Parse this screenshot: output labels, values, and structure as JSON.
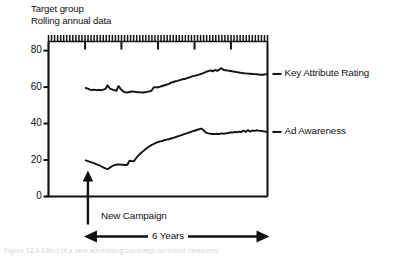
{
  "title": {
    "line1": "Target group",
    "line2": "Rolling annual data"
  },
  "legend": {
    "series1_label": "Key Attribute Rating",
    "series2_label": "Ad Awareness"
  },
  "annotations": {
    "campaign_label": "New Campaign",
    "span_label": "6 Years"
  },
  "caption": "Figure 12.4  Effect of a new advertising campaign on brand measures",
  "colors": {
    "ink": "#111111",
    "background": "#ffffff",
    "series1": "#111111",
    "series2": "#111111"
  },
  "chart_data": {
    "type": "line",
    "xlabel": "",
    "ylabel": "",
    "ylim": [
      0,
      85
    ],
    "yticks": [
      0,
      20,
      40,
      60,
      80
    ],
    "ytick_labels": [
      "0",
      "20",
      "40",
      "60",
      "80"
    ],
    "xlim": [
      0,
      100
    ],
    "grid": false,
    "legend_position": "right",
    "x_axis_note": "Time axis, unlabelled; dense minor tick ruler along the top border with 5 major ticks",
    "top_ruler": {
      "minor_tick_count": 72,
      "major_tick_positions": [
        16.7,
        33.3,
        50.0,
        66.7,
        83.3
      ]
    },
    "annotations": [
      {
        "type": "vertical-arrow",
        "text": "New Campaign",
        "x": 18.0,
        "description": "Upward arrow from below the x axis marking the campaign launch"
      },
      {
        "type": "double-arrow",
        "text": "6 Years",
        "x_start": 18.0,
        "x_end": 100.0,
        "description": "Horizontal double-headed arrow spanning the post-launch period"
      }
    ],
    "series": [
      {
        "name": "Key Attribute Rating",
        "x": [
          17,
          18,
          19,
          20,
          21,
          22,
          23,
          24,
          25,
          26,
          27,
          28,
          29,
          30,
          31,
          32,
          33,
          34,
          35,
          36,
          37,
          38,
          39,
          40,
          41,
          42,
          43,
          44,
          45,
          46,
          47,
          48,
          49,
          50,
          51,
          52,
          53,
          54,
          55,
          56,
          57,
          58,
          59,
          60,
          61,
          62,
          63,
          64,
          65,
          66,
          67,
          68,
          69,
          70,
          71,
          72,
          73,
          74,
          75,
          76,
          77,
          78,
          79,
          80,
          81,
          82,
          83,
          84,
          85,
          86,
          87,
          88,
          89,
          90,
          91,
          92,
          93,
          94,
          95,
          96,
          97,
          98,
          99,
          100
        ],
        "values": [
          59.5,
          59.2,
          58.6,
          58.4,
          58.6,
          58.3,
          58.5,
          58.3,
          58.6,
          59.0,
          61.0,
          59.2,
          58.7,
          58.3,
          58.0,
          60.6,
          58.9,
          57.7,
          57.2,
          57.0,
          57.3,
          57.6,
          57.5,
          57.3,
          57.2,
          57.1,
          57.0,
          57.2,
          57.4,
          57.6,
          58.0,
          59.8,
          60.0,
          59.8,
          60.2,
          60.6,
          61.0,
          61.4,
          61.8,
          62.4,
          62.8,
          63.2,
          63.4,
          63.8,
          64.2,
          64.4,
          64.8,
          65.2,
          65.6,
          66.0,
          66.3,
          66.6,
          67.0,
          67.4,
          67.8,
          68.4,
          68.8,
          69.2,
          68.6,
          69.4,
          68.9,
          69.6,
          70.4,
          69.4,
          69.2,
          69.0,
          68.8,
          68.6,
          68.4,
          68.2,
          68.0,
          67.8,
          67.6,
          67.5,
          67.4,
          67.3,
          67.2,
          67.1,
          67.0,
          66.9,
          66.8,
          66.8,
          67.0,
          67.2
        ]
      },
      {
        "name": "Ad Awareness",
        "x": [
          17,
          18,
          19,
          20,
          21,
          22,
          23,
          24,
          25,
          26,
          27,
          28,
          29,
          30,
          31,
          32,
          33,
          34,
          35,
          36,
          37,
          38,
          39,
          40,
          41,
          42,
          43,
          44,
          45,
          46,
          47,
          48,
          49,
          50,
          51,
          52,
          53,
          54,
          55,
          56,
          57,
          58,
          59,
          60,
          61,
          62,
          63,
          64,
          65,
          66,
          67,
          68,
          69,
          70,
          71,
          72,
          73,
          74,
          75,
          76,
          77,
          78,
          79,
          80,
          81,
          82,
          83,
          84,
          85,
          86,
          87,
          88,
          89,
          90,
          91,
          92,
          93,
          94,
          95,
          96,
          97,
          98,
          99,
          100
        ],
        "values": [
          19.8,
          19.4,
          19.0,
          18.6,
          18.2,
          17.6,
          17.2,
          16.6,
          16.0,
          15.4,
          15.0,
          15.8,
          16.6,
          17.2,
          17.4,
          17.6,
          17.5,
          17.4,
          17.3,
          17.4,
          19.6,
          19.4,
          19.3,
          21.0,
          22.4,
          23.6,
          24.6,
          25.6,
          26.6,
          27.4,
          28.2,
          28.8,
          29.4,
          29.8,
          30.2,
          30.4,
          31.0,
          31.2,
          31.4,
          31.8,
          32.2,
          32.6,
          33.0,
          33.4,
          33.8,
          34.2,
          34.6,
          35.0,
          35.4,
          35.8,
          36.2,
          36.6,
          37.0,
          37.2,
          36.0,
          35.0,
          34.6,
          34.4,
          34.3,
          34.2,
          34.4,
          34.2,
          34.6,
          34.4,
          34.6,
          34.8,
          35.2,
          35.0,
          35.4,
          35.2,
          35.6,
          35.4,
          36.2,
          35.4,
          36.4,
          35.6,
          36.2,
          36.0,
          36.3,
          36.1,
          36.0,
          35.8,
          35.6,
          35.4
        ]
      }
    ]
  }
}
